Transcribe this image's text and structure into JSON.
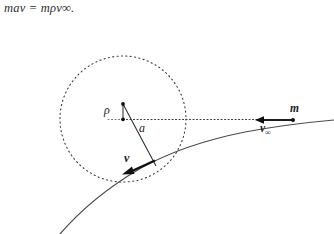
{
  "figure": {
    "type": "physics-scattering-diagram",
    "caption_formula": "mav = mρv∞.",
    "background_color": "#ffffff",
    "stroke_color": "#2b2b2b",
    "labels": {
      "impact_parameter": "ρ",
      "closest_approach": "a",
      "velocity_at_perihelion": "v",
      "mass": "m",
      "velocity_at_infinity": "v",
      "velocity_at_infinity_sub": "∞"
    },
    "geometry": {
      "circle_center_x": 123,
      "circle_center_y": 119,
      "circle_radius": 63,
      "focus_dot_x": 123,
      "focus_dot_y": 119,
      "top_dot_x": 123,
      "top_dot_y": 104,
      "perihelion_x": 154,
      "perihelion_y": 162,
      "asymptote_dot_x": 293,
      "asymptote_dot_y": 120,
      "axis_line_from_x": 123,
      "axis_line_to_x": 265
    }
  }
}
